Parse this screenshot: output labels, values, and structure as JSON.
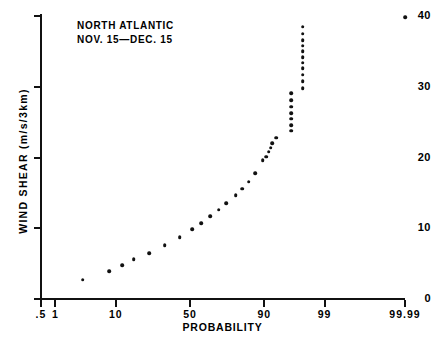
{
  "chart_data": {
    "type": "scatter",
    "title": "",
    "annotation_lines": [
      "NORTH ATLANTIC",
      "NOV. 15—DEC. 15"
    ],
    "xlabel": "PROBABILITY",
    "ylabel": "WIND SHEAR (m/s/3km)",
    "x_scale": "probability (probit)",
    "xlim": [
      0.5,
      99.99
    ],
    "ylim": [
      0,
      40
    ],
    "grid": false,
    "legend": null,
    "x_ticks": [
      {
        "label": ".5",
        "value": 0.5
      },
      {
        "label": "1",
        "value": 1
      },
      {
        "label": "10",
        "value": 10
      },
      {
        "label": "50",
        "value": 50
      },
      {
        "label": "90",
        "value": 90
      },
      {
        "label": "99",
        "value": 99
      },
      {
        "label": "99.99",
        "value": 99.99
      }
    ],
    "y_ticks": [
      {
        "label": "0",
        "value": 0
      },
      {
        "label": "10",
        "value": 10
      },
      {
        "label": "20",
        "value": 20
      },
      {
        "label": "30",
        "value": 30
      },
      {
        "label": "40",
        "value": 40
      }
    ],
    "series": [
      {
        "name": "wind shear cumulative distribution",
        "marker": "filled-circle",
        "color": "#111111",
        "points": [
          {
            "x": 3.2,
            "y": 2.7
          },
          {
            "x": 8.2,
            "y": 3.9
          },
          {
            "x": 12.0,
            "y": 4.8
          },
          {
            "x": 16.5,
            "y": 5.6
          },
          {
            "x": 24.0,
            "y": 6.5
          },
          {
            "x": 33.0,
            "y": 7.6
          },
          {
            "x": 43.0,
            "y": 8.7
          },
          {
            "x": 51.5,
            "y": 9.9
          },
          {
            "x": 57.5,
            "y": 10.7
          },
          {
            "x": 63.5,
            "y": 11.7
          },
          {
            "x": 69.0,
            "y": 12.6
          },
          {
            "x": 73.5,
            "y": 13.5
          },
          {
            "x": 78.5,
            "y": 14.7
          },
          {
            "x": 81.5,
            "y": 15.6
          },
          {
            "x": 84.5,
            "y": 16.6
          },
          {
            "x": 87.0,
            "y": 17.8
          },
          {
            "x": 89.5,
            "y": 19.6
          },
          {
            "x": 90.5,
            "y": 20.1
          },
          {
            "x": 91.3,
            "y": 20.8
          },
          {
            "x": 91.8,
            "y": 21.4
          },
          {
            "x": 92.2,
            "y": 22.0
          },
          {
            "x": 93.2,
            "y": 22.8
          },
          {
            "x": 96.0,
            "y": 23.8
          },
          {
            "x": 96.0,
            "y": 24.6
          },
          {
            "x": 96.0,
            "y": 25.5
          },
          {
            "x": 96.0,
            "y": 26.3
          },
          {
            "x": 96.0,
            "y": 27.2
          },
          {
            "x": 96.0,
            "y": 28.1
          },
          {
            "x": 96.0,
            "y": 29.1
          },
          {
            "x": 97.4,
            "y": 29.8
          },
          {
            "x": 97.4,
            "y": 30.8
          },
          {
            "x": 97.4,
            "y": 31.7
          },
          {
            "x": 97.4,
            "y": 32.6
          },
          {
            "x": 97.4,
            "y": 33.4
          },
          {
            "x": 97.4,
            "y": 34.2
          },
          {
            "x": 97.4,
            "y": 35.0
          },
          {
            "x": 97.4,
            "y": 35.8
          },
          {
            "x": 97.4,
            "y": 36.6
          },
          {
            "x": 97.4,
            "y": 37.5
          },
          {
            "x": 97.4,
            "y": 38.5
          },
          {
            "x": 99.99,
            "y": 39.8
          }
        ]
      }
    ]
  }
}
